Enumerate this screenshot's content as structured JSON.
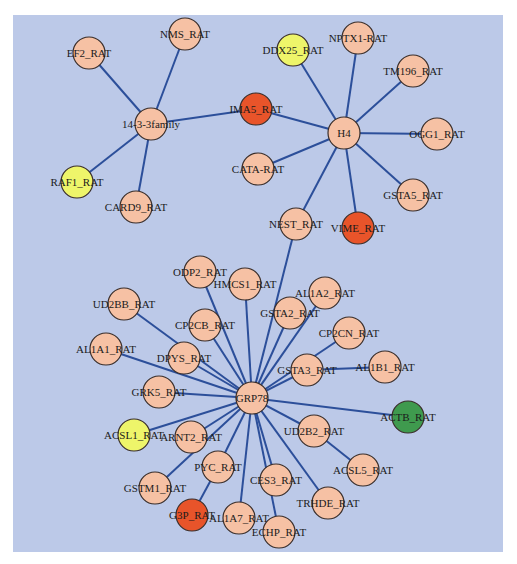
{
  "diagram": {
    "type": "network",
    "background_color": "#bcc9e8",
    "edge_color": "#2c4f9a",
    "node_radius": 16,
    "colors": {
      "default": "#f6c1a4",
      "red": "#e8542a",
      "yellow": "#eef56a",
      "green": "#3f9a4e"
    },
    "nodes": [
      {
        "id": "14-3-3family",
        "label": "14-3-3family",
        "x": 151,
        "y": 124,
        "color": "default"
      },
      {
        "id": "EF2_RAT",
        "label": "EF2_RAT",
        "x": 89,
        "y": 53,
        "color": "default"
      },
      {
        "id": "NMS_RAT",
        "label": "NMS_RAT",
        "x": 185,
        "y": 34,
        "color": "default"
      },
      {
        "id": "RAF1_RAT",
        "label": "RAF1_RAT",
        "x": 77,
        "y": 182,
        "color": "yellow"
      },
      {
        "id": "CARD9_RAT",
        "label": "CARD9_RAT",
        "x": 136,
        "y": 207,
        "color": "default"
      },
      {
        "id": "IMA5_RAT",
        "label": "IMA5_RAT",
        "x": 256,
        "y": 109,
        "color": "red"
      },
      {
        "id": "H4",
        "label": "H4",
        "x": 344,
        "y": 133,
        "color": "default"
      },
      {
        "id": "DDX25_RAT",
        "label": "DDX25_RAT",
        "x": 293,
        "y": 50,
        "color": "yellow"
      },
      {
        "id": "NPTX1-RAT",
        "label": "NPTX1-RAT",
        "x": 358,
        "y": 38,
        "color": "default"
      },
      {
        "id": "TM196_RAT",
        "label": "TM196_RAT",
        "x": 413,
        "y": 71,
        "color": "default"
      },
      {
        "id": "OGG1_RAT",
        "label": "OGG1_RAT",
        "x": 437,
        "y": 134,
        "color": "default"
      },
      {
        "id": "GSTA5_RAT",
        "label": "GSTA5_RAT",
        "x": 413,
        "y": 195,
        "color": "default"
      },
      {
        "id": "CATA-RAT",
        "label": "CATA-RAT",
        "x": 258,
        "y": 169,
        "color": "default"
      },
      {
        "id": "VIME_RAT",
        "label": "VIME_RAT",
        "x": 358,
        "y": 228,
        "color": "red"
      },
      {
        "id": "NEST_RAT",
        "label": "NEST_RAT",
        "x": 296,
        "y": 224,
        "color": "default"
      },
      {
        "id": "GRP78",
        "label": "GRP78",
        "x": 252,
        "y": 398,
        "color": "default"
      },
      {
        "id": "ODP2_RAT",
        "label": "ODP2_RAT",
        "x": 200,
        "y": 272,
        "color": "default"
      },
      {
        "id": "HMCS1_RAT",
        "label": "HMCS1_RAT",
        "x": 245,
        "y": 284,
        "color": "default"
      },
      {
        "id": "UD2BB_RAT",
        "label": "UD2BB_RAT",
        "x": 124,
        "y": 304,
        "color": "default"
      },
      {
        "id": "CP2CB_RAT",
        "label": "CP2CB_RAT",
        "x": 205,
        "y": 325,
        "color": "default"
      },
      {
        "id": "AL1A1_RAT",
        "label": "AL1A1_RAT",
        "x": 106,
        "y": 349,
        "color": "default"
      },
      {
        "id": "DPYS_RAT",
        "label": "DPYS_RAT",
        "x": 184,
        "y": 358,
        "color": "default"
      },
      {
        "id": "GRK5_RAT",
        "label": "GRK5_RAT",
        "x": 159,
        "y": 392,
        "color": "default"
      },
      {
        "id": "ACSL1_RAT",
        "label": "ACSL1_RAT",
        "x": 134,
        "y": 435,
        "color": "yellow"
      },
      {
        "id": "ARNT2_RAT",
        "label": "ARNT2_RAT",
        "x": 191,
        "y": 437,
        "color": "default"
      },
      {
        "id": "GSTM1_RAT",
        "label": "GSTM1_RAT",
        "x": 155,
        "y": 488,
        "color": "default"
      },
      {
        "id": "PYC_RAT",
        "label": "PYC_RAT",
        "x": 218,
        "y": 467,
        "color": "default"
      },
      {
        "id": "G3P_RAT",
        "label": "G3P_RAT",
        "x": 192,
        "y": 515,
        "color": "red"
      },
      {
        "id": "AL1A7_RAT",
        "label": "AL1A7_RAT",
        "x": 239,
        "y": 518,
        "color": "default"
      },
      {
        "id": "ECHP_RAT",
        "label": "ECHP_RAT",
        "x": 279,
        "y": 532,
        "color": "default"
      },
      {
        "id": "CES3_RAT",
        "label": "CES3_RAT",
        "x": 276,
        "y": 480,
        "color": "default"
      },
      {
        "id": "TRHDE_RAT",
        "label": "TRHDE_RAT",
        "x": 328,
        "y": 503,
        "color": "default"
      },
      {
        "id": "UD2B2_RAT",
        "label": "UD2B2_RAT",
        "x": 314,
        "y": 431,
        "color": "default"
      },
      {
        "id": "ACSL5_RAT",
        "label": "ACSL5_RAT",
        "x": 363,
        "y": 470,
        "color": "default"
      },
      {
        "id": "ACTB_RAT",
        "label": "ACTB_RAT",
        "x": 408,
        "y": 417,
        "color": "green"
      },
      {
        "id": "AL1B1_RAT",
        "label": "AL1B1_RAT",
        "x": 385,
        "y": 367,
        "color": "default"
      },
      {
        "id": "GSTA3_RAT",
        "label": "GSTA3_RAT",
        "x": 307,
        "y": 370,
        "color": "default"
      },
      {
        "id": "CP2CN_RAT",
        "label": "CP2CN_RAT",
        "x": 349,
        "y": 333,
        "color": "default"
      },
      {
        "id": "GSTA2_RAT",
        "label": "GSTA2_RAT",
        "x": 290,
        "y": 313,
        "color": "default"
      },
      {
        "id": "AL1A2_RAT",
        "label": "AL1A2_RAT",
        "x": 325,
        "y": 293,
        "color": "default"
      }
    ],
    "edges": [
      [
        "14-3-3family",
        "EF2_RAT"
      ],
      [
        "14-3-3family",
        "NMS_RAT"
      ],
      [
        "14-3-3family",
        "RAF1_RAT"
      ],
      [
        "14-3-3family",
        "CARD9_RAT"
      ],
      [
        "14-3-3family",
        "IMA5_RAT"
      ],
      [
        "IMA5_RAT",
        "H4"
      ],
      [
        "H4",
        "DDX25_RAT"
      ],
      [
        "H4",
        "NPTX1-RAT"
      ],
      [
        "H4",
        "TM196_RAT"
      ],
      [
        "H4",
        "OGG1_RAT"
      ],
      [
        "H4",
        "GSTA5_RAT"
      ],
      [
        "H4",
        "CATA-RAT"
      ],
      [
        "H4",
        "VIME_RAT"
      ],
      [
        "H4",
        "NEST_RAT"
      ],
      [
        "NEST_RAT",
        "GRP78"
      ],
      [
        "GRP78",
        "ODP2_RAT"
      ],
      [
        "GRP78",
        "HMCS1_RAT"
      ],
      [
        "GRP78",
        "UD2BB_RAT"
      ],
      [
        "GRP78",
        "CP2CB_RAT"
      ],
      [
        "GRP78",
        "AL1A1_RAT"
      ],
      [
        "GRP78",
        "DPYS_RAT"
      ],
      [
        "GRP78",
        "GRK5_RAT"
      ],
      [
        "GRP78",
        "ACSL1_RAT"
      ],
      [
        "GRP78",
        "ARNT2_RAT"
      ],
      [
        "GRP78",
        "GSTM1_RAT"
      ],
      [
        "GRP78",
        "PYC_RAT"
      ],
      [
        "PYC_RAT",
        "G3P_RAT"
      ],
      [
        "GRP78",
        "AL1A7_RAT"
      ],
      [
        "GRP78",
        "ECHP_RAT"
      ],
      [
        "GRP78",
        "CES3_RAT"
      ],
      [
        "GRP78",
        "TRHDE_RAT"
      ],
      [
        "GRP78",
        "UD2B2_RAT"
      ],
      [
        "UD2B2_RAT",
        "ACSL5_RAT"
      ],
      [
        "GRP78",
        "ACTB_RAT"
      ],
      [
        "GRP78",
        "GSTA3_RAT"
      ],
      [
        "GSTA3_RAT",
        "AL1B1_RAT"
      ],
      [
        "GRP78",
        "CP2CN_RAT"
      ],
      [
        "GRP78",
        "GSTA2_RAT"
      ],
      [
        "GRP78",
        "AL1A2_RAT"
      ]
    ]
  }
}
